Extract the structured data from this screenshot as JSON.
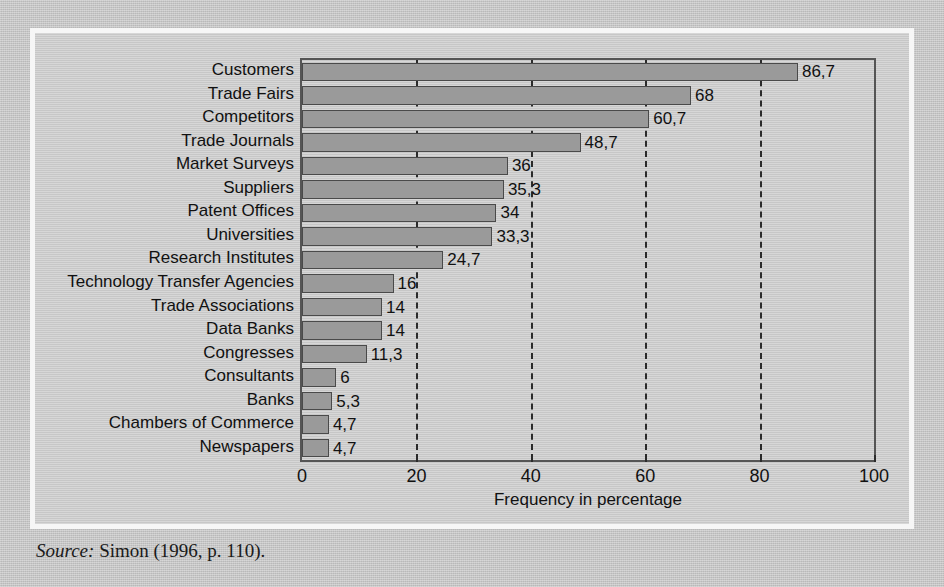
{
  "figure": {
    "source_label": "Source:",
    "source_text": "Simon (1996, p. 110)."
  },
  "chart_data": {
    "type": "bar",
    "orientation": "horizontal",
    "title": "",
    "xlabel": "Frequency in percentage",
    "ylabel": "",
    "xlim": [
      0,
      100
    ],
    "xticks": [
      0,
      20,
      40,
      60,
      80,
      100
    ],
    "xtick_labels": [
      "0",
      "20",
      "40",
      "60",
      "80",
      "100"
    ],
    "gridlines": [
      20,
      40,
      60,
      80
    ],
    "grid": true,
    "legend": false,
    "bar_color": "#9a9a9a",
    "bar_edge_color": "#4a4a4a",
    "plot_background": "#cfcfcf",
    "categories": [
      "Customers",
      "Trade Fairs",
      "Competitors",
      "Trade Journals",
      "Market Surveys",
      "Suppliers",
      "Patent Offices",
      "Universities",
      "Research Institutes",
      "Technology Transfer Agencies",
      "Trade Associations",
      "Data Banks",
      "Congresses",
      "Consultants",
      "Banks",
      "Chambers of Commerce",
      "Newspapers"
    ],
    "values": [
      86.7,
      68,
      60.7,
      48.7,
      36,
      35.3,
      34,
      33.3,
      24.7,
      16,
      14,
      14,
      11.3,
      6,
      5.3,
      4.7,
      4.7
    ],
    "value_labels": [
      "86,7",
      "68",
      "60,7",
      "48,7",
      "36",
      "35,3",
      "34",
      "33,3",
      "24,7",
      "16",
      "14",
      "14",
      "11,3",
      "6",
      "5,3",
      "4,7",
      "4,7"
    ]
  }
}
